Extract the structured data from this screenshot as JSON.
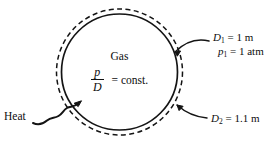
{
  "figure": {
    "background_color": "#ffffff",
    "line_color": "#111111"
  },
  "interior": {
    "substance_label": "Gas",
    "relation": {
      "numerator": "p",
      "denominator": "D",
      "equals": "= const."
    }
  },
  "callouts": {
    "state1": {
      "diameter": "D",
      "diameter_sub": "1",
      "diameter_value": "= 1 m",
      "pressure": "p",
      "pressure_sub": "1",
      "pressure_value": "= 1 atm"
    },
    "state2": {
      "diameter": "D",
      "diameter_sub": "2",
      "diameter_value": "= 1.1 m"
    }
  },
  "energy": {
    "heat_label": "Heat"
  },
  "geometry": {
    "center_x": 119.5,
    "center_y": 72,
    "solid_radius": 58,
    "dashed_radius": 63,
    "dash_pattern": "5,3"
  }
}
